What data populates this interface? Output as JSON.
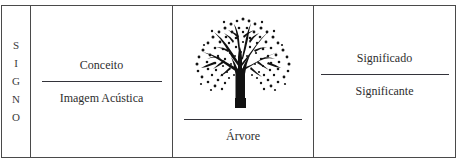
{
  "figure": {
    "title_bleed": "",
    "background_color": "#ffffff",
    "border_color": "#4a4a4a",
    "text_color": "#2e2e2e",
    "rule_color": "#33333a"
  },
  "columns": {
    "signo": {
      "label": "SIGNO",
      "letters": [
        "S",
        "I",
        "G",
        "N",
        "O"
      ]
    },
    "concept": {
      "upper_term": "Conceito",
      "lower_term": "Imagem Acústica"
    },
    "tree": {
      "illustration_name": "tree-illustration",
      "caption": "Árvore"
    },
    "signification": {
      "upper_term": "Significado",
      "lower_term": "Significante"
    }
  }
}
